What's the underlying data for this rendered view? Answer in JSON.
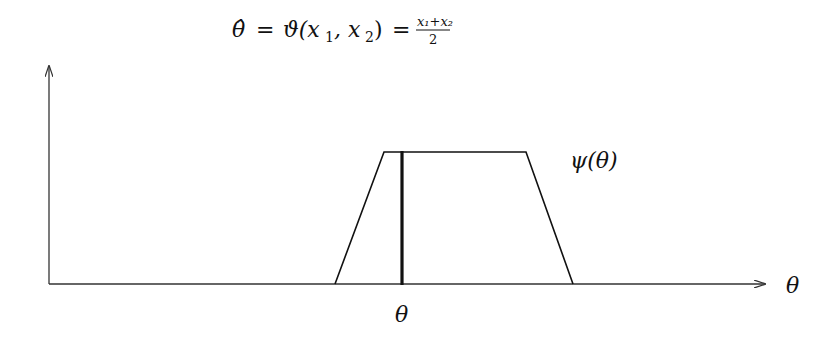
{
  "title": {
    "lhs": "θ̂",
    "eq1": "=",
    "func": "ϑ(x",
    "sub1": "1",
    "comma": ", x",
    "sub2": "2",
    "close": ")",
    "eq2": "=",
    "numerator": "x₁+x₂",
    "denominator": "2"
  },
  "curve_label": "ψ(θ)",
  "x_axis_label": "θ",
  "marker_label": "θ",
  "colors": {
    "line": "#111111",
    "axis": "#333333"
  },
  "shape": {
    "type": "trapezoid",
    "baseline_y": 284,
    "points": [
      [
        49,
        284
      ],
      [
        335,
        284
      ],
      [
        384,
        152
      ],
      [
        526,
        152
      ],
      [
        573,
        284
      ],
      [
        765,
        284
      ]
    ],
    "marker_x": 402
  }
}
